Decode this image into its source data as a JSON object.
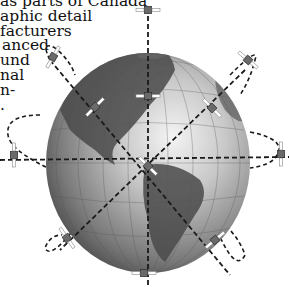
{
  "text_fragments": [
    "as parts of Canada",
    "aphic detail",
    "facturers",
    "anced",
    "und",
    "nal",
    "n-",
    "."
  ],
  "diagram": {
    "globe": {
      "cx": 148,
      "cy": 163,
      "rx": 102,
      "ry": 110,
      "color_light": "#f2f2f2",
      "color_dark": "#3a3a3a"
    },
    "orbit_lines": [
      "vertical",
      "horizontal",
      "diagonal-nw-se",
      "diagonal-ne-sw"
    ],
    "satellite_count": 13,
    "colors": {
      "dash": "#1a1a1a",
      "satellite": "#555555",
      "panel": "#ffffff"
    }
  }
}
